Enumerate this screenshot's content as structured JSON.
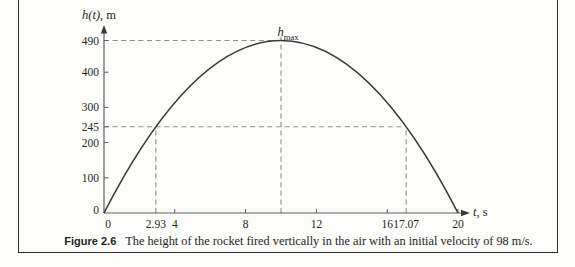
{
  "figure": {
    "caption_label": "Figure 2.6",
    "caption_text": "The height of the rocket fired vertically in the air with an initial velocity of 98 m/s."
  },
  "axes": {
    "y_label_math": "h(t)",
    "y_label_unit": ", m",
    "x_label_math": "t",
    "x_label_unit": ", s",
    "peak_label_base": "h",
    "peak_label_sub": "max"
  },
  "chart_data": {
    "type": "line",
    "function": "h(t) = 98t − 4.9t²",
    "xlabel": "t, s",
    "ylabel": "h(t), m",
    "xlim": [
      0,
      20
    ],
    "ylim": [
      0,
      490
    ],
    "grid": false,
    "x_ticks": [
      0,
      4,
      8,
      12,
      16,
      20
    ],
    "y_ticks": [
      0,
      100,
      200,
      300,
      400
    ],
    "special_x_ticks": [
      "2.93",
      "17.07"
    ],
    "special_y_ticks": [
      245,
      490
    ],
    "series": [
      {
        "name": "h(t)",
        "x": [
          0,
          2,
          4,
          6,
          8,
          10,
          12,
          14,
          16,
          18,
          20
        ],
        "y": [
          0,
          176.4,
          313.6,
          411.6,
          470.4,
          490,
          470.4,
          411.6,
          313.6,
          176.4,
          0
        ]
      }
    ],
    "peak": {
      "t": 10,
      "h": 490,
      "label": "hmax"
    },
    "key_points": [
      {
        "t": 2.93,
        "h": 245
      },
      {
        "t": 10,
        "h": 490
      },
      {
        "t": 17.07,
        "h": 245
      },
      {
        "t": 20,
        "h": 0
      }
    ],
    "guides": [
      {
        "type": "h",
        "h": 490,
        "t_end": 10
      },
      {
        "type": "v",
        "t": 10,
        "h_end": 490
      },
      {
        "type": "h",
        "h": 245,
        "t_end": 17.07
      },
      {
        "type": "v",
        "t": 2.93,
        "h_end": 245
      },
      {
        "type": "v",
        "t": 17.07,
        "h_end": 245
      }
    ],
    "colors": {
      "curve": "#3a3a3a",
      "dashed": "#8f8f8f",
      "axis": "#5e5e5e",
      "text": "#262626",
      "border": "#2e2e2e",
      "page_rule": "#b3b3b3",
      "background": "#fcfcfa"
    }
  }
}
